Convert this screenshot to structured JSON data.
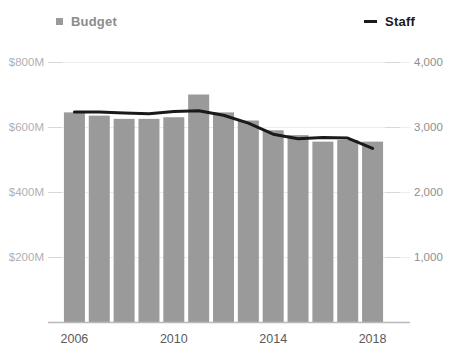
{
  "legend": {
    "budget": {
      "label": "Budget",
      "marker": "square-swatch-icon",
      "color": "#9a9a9a"
    },
    "staff": {
      "label": "Staff",
      "marker": "dash-line-icon",
      "color": "#1a1a1a"
    }
  },
  "chart_data": {
    "type": "bar",
    "title": "",
    "subtitle": "",
    "xlabel": "",
    "ylabel": "",
    "grid": true,
    "legend_position": "top",
    "categories": [
      "2006",
      "2007",
      "2008",
      "2009",
      "2010",
      "2011",
      "2012",
      "2013",
      "2014",
      "2015",
      "2016",
      "2017",
      "2018"
    ],
    "x_tick_labels": [
      "2006",
      "2010",
      "2014",
      "2018"
    ],
    "x_tick_categories": [
      "2006",
      "2010",
      "2014",
      "2018"
    ],
    "axes": {
      "left": {
        "label": "Budget",
        "ylim": [
          0,
          800
        ],
        "ticks": [
          200,
          400,
          600,
          800
        ],
        "tick_labels": [
          "$200M",
          "$400M",
          "$600M",
          "$800M"
        ],
        "unit": "millions of dollars"
      },
      "right": {
        "label": "Staff",
        "ylim": [
          0,
          4000
        ],
        "ticks": [
          1000,
          2000,
          3000,
          4000
        ],
        "tick_labels": [
          "1,000",
          "2,000",
          "3,000",
          "4,000"
        ],
        "unit": "staff"
      }
    },
    "series": [
      {
        "name": "Budget",
        "type": "bar",
        "axis": "left",
        "color": "#9a9a9a",
        "values": [
          645,
          635,
          625,
          625,
          630,
          700,
          645,
          620,
          590,
          575,
          555,
          560,
          555
        ]
      },
      {
        "name": "Staff",
        "type": "line",
        "axis": "right",
        "color": "#1a1a1a",
        "values": [
          3230,
          3230,
          3215,
          3205,
          3240,
          3250,
          3180,
          3060,
          2890,
          2820,
          2840,
          2830,
          2670
        ]
      }
    ]
  }
}
